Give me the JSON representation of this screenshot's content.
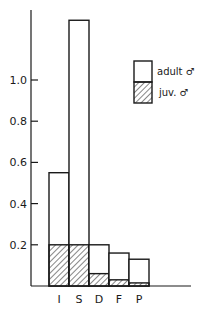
{
  "chart_data": {
    "type": "bar",
    "stacked": true,
    "title": "",
    "xlabel": "",
    "ylabel": "",
    "categories": [
      "I",
      "S",
      "D",
      "F",
      "P"
    ],
    "series": [
      {
        "name": "juv. ♂",
        "pattern": "hatched",
        "values": [
          0.2,
          0.2,
          0.06,
          0.03,
          0.015
        ]
      },
      {
        "name": "adult ♂",
        "pattern": "open",
        "values": [
          0.35,
          1.09,
          0.14,
          0.13,
          0.115
        ]
      }
    ],
    "totals": [
      0.55,
      1.29,
      0.2,
      0.16,
      0.13
    ],
    "ylim": [
      0,
      1.3
    ],
    "yticks": [
      0.2,
      0.4,
      0.6,
      0.8,
      1.0
    ],
    "ytick_labels": [
      "0.2",
      "0.4",
      "0.6",
      "0.8",
      "1.0"
    ],
    "grid": false,
    "legend_position": "upper right"
  },
  "legend": {
    "adult_label": "adult ♂",
    "juv_label": "juv. ♂"
  }
}
